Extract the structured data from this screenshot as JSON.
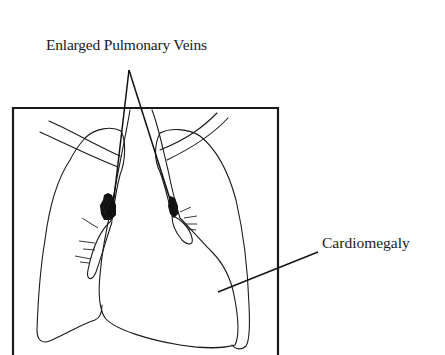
{
  "figure": {
    "labels": {
      "veins": "Enlarged Pulmonary Veins",
      "cardiomegaly": "Cardiomegaly"
    },
    "colors": {
      "ink": "#1a1a1a",
      "background": "#ffffff"
    },
    "frame": {
      "left": 13,
      "top": 108,
      "right": 278,
      "bottom": 355
    },
    "pointers": {
      "veins_apex": [
        129,
        70
      ],
      "veins_left_end": [
        112,
        215
      ],
      "veins_right_end": [
        175,
        215
      ],
      "cardio_start": [
        318,
        252
      ],
      "cardio_end": [
        218,
        292
      ]
    }
  }
}
